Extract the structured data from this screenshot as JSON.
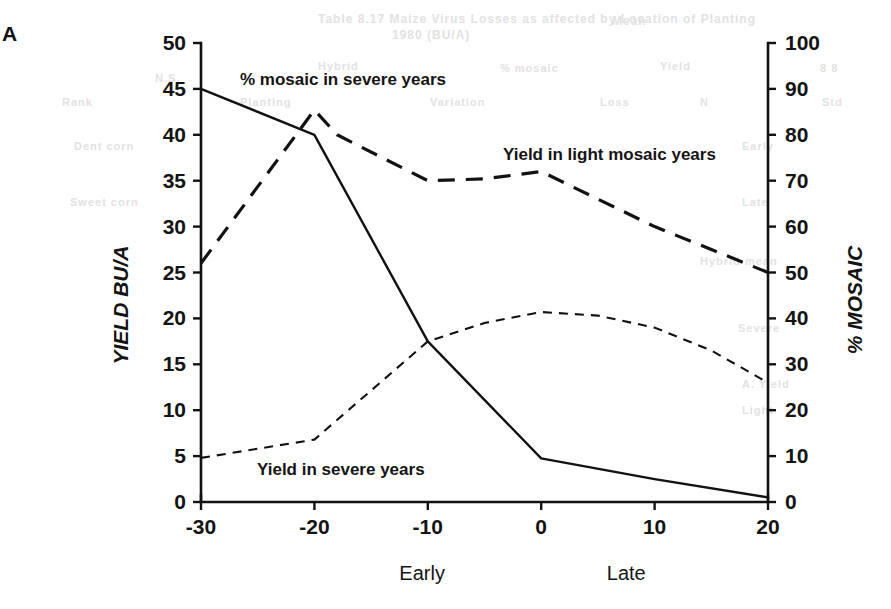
{
  "panel": {
    "label": "A"
  },
  "chart_data": {
    "type": "line",
    "title": "",
    "xlabel": "",
    "ylabel": "YIELD BU/A",
    "y2label": "% MOSAIC",
    "xlim": [
      -30,
      20
    ],
    "ylim": [
      0,
      50
    ],
    "y2lim": [
      0,
      100
    ],
    "grid": false,
    "legend": "inline-annotations",
    "xticks": [
      -30,
      -20,
      -10,
      0,
      10,
      20
    ],
    "xtick_labels": [
      "-30",
      "-20",
      "-10",
      "0",
      "10",
      "20"
    ],
    "yticks": [
      0,
      5,
      10,
      15,
      20,
      25,
      30,
      35,
      40,
      45,
      50
    ],
    "ytick_labels": [
      "0",
      "5",
      "10",
      "15",
      "20",
      "25",
      "30",
      "35",
      "40",
      "45",
      "50"
    ],
    "y2ticks": [
      0,
      10,
      20,
      30,
      40,
      50,
      60,
      70,
      80,
      90,
      100
    ],
    "y2tick_labels": [
      "0",
      "10",
      "20",
      "30",
      "40",
      "50",
      "60",
      "70",
      "80",
      "90",
      "100"
    ],
    "x_axis_annotations": [
      {
        "text": "Early",
        "x": -10.5
      },
      {
        "text": "Late",
        "x": 7.5
      }
    ],
    "series": [
      {
        "name": "% mosaic in severe years",
        "axis": "right",
        "style": "solid",
        "x": [
          -30,
          -20,
          -10,
          0,
          10,
          20
        ],
        "values": [
          90,
          80,
          35,
          9.5,
          5,
          1
        ]
      },
      {
        "name": "Yield in light mosaic years",
        "axis": "left",
        "style": "long-dash",
        "x": [
          -30,
          -20,
          -18,
          -10,
          -5,
          0,
          5,
          10,
          15,
          20
        ],
        "values": [
          26,
          42.7,
          40,
          35,
          35.2,
          36,
          33,
          30,
          27.5,
          25
        ]
      },
      {
        "name": "Yield in severe years",
        "axis": "left",
        "style": "short-dash",
        "x": [
          -30,
          -20,
          -10,
          -5,
          0,
          5,
          10,
          15,
          20
        ],
        "values": [
          4.8,
          6.8,
          17.5,
          19.5,
          20.7,
          20.3,
          19,
          16.5,
          13
        ]
      }
    ],
    "annotations": [
      {
        "name": "% mosaic in severe years",
        "text": "% mosaic in severe years",
        "x_px": 240,
        "y_px": 85
      },
      {
        "name": "Yield in light mosaic years",
        "text": "Yield in light mosaic years",
        "x_px": 503,
        "y_px": 160
      },
      {
        "name": "Yield in severe years",
        "text": "Yield in severe years",
        "x_px": 257,
        "y_px": 475
      }
    ]
  },
  "bleed_text": [
    {
      "text": "Table 8.17  Maize Virus Losses as affected by Location of Planting",
      "x": 318,
      "y": 12,
      "size": 12
    },
    {
      "text": "1980 (BU/A)",
      "x": 392,
      "y": 28,
      "size": 12
    },
    {
      "text": "Mean",
      "x": 612,
      "y": 14,
      "size": 12
    },
    {
      "text": "N.S.",
      "x": 155,
      "y": 72,
      "size": 11
    },
    {
      "text": "Hybrid",
      "x": 318,
      "y": 60,
      "size": 11
    },
    {
      "text": "% mosaic",
      "x": 500,
      "y": 62,
      "size": 11
    },
    {
      "text": "Yield",
      "x": 660,
      "y": 60,
      "size": 11
    },
    {
      "text": "Rank",
      "x": 62,
      "y": 96,
      "size": 11
    },
    {
      "text": "Planting",
      "x": 240,
      "y": 96,
      "size": 11
    },
    {
      "text": "Variation",
      "x": 430,
      "y": 96,
      "size": 11
    },
    {
      "text": "Loss",
      "x": 600,
      "y": 96,
      "size": 11
    },
    {
      "text": "N",
      "x": 700,
      "y": 96,
      "size": 11
    },
    {
      "text": "Dent corn",
      "x": 74,
      "y": 140,
      "size": 11
    },
    {
      "text": "Early",
      "x": 742,
      "y": 140,
      "size": 11
    },
    {
      "text": "Sweet corn",
      "x": 70,
      "y": 196,
      "size": 11
    },
    {
      "text": "Late",
      "x": 742,
      "y": 196,
      "size": 11
    },
    {
      "text": "Hybrid mean",
      "x": 700,
      "y": 255,
      "size": 11
    },
    {
      "text": "Severe",
      "x": 738,
      "y": 322,
      "size": 11
    },
    {
      "text": "A. Yield",
      "x": 742,
      "y": 378,
      "size": 11
    },
    {
      "text": "Light",
      "x": 742,
      "y": 404,
      "size": 11
    },
    {
      "text": "8  8",
      "x": 820,
      "y": 62,
      "size": 11
    },
    {
      "text": "Std",
      "x": 822,
      "y": 96,
      "size": 11
    }
  ]
}
